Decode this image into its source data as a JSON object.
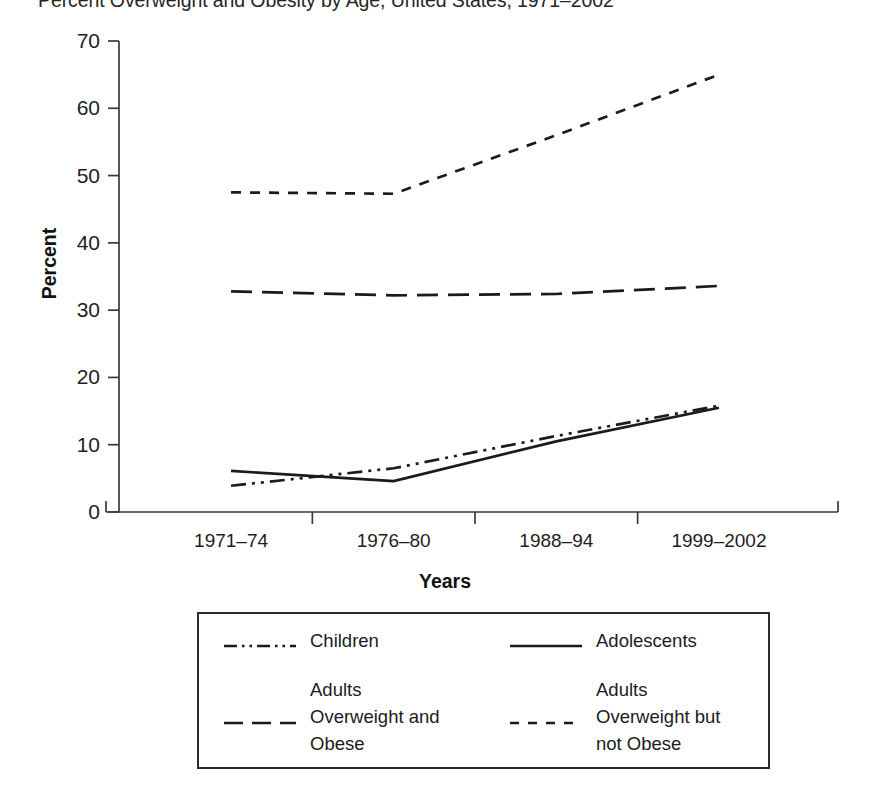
{
  "chart_data": {
    "type": "line",
    "title": "Percent Overweight and Obesity by Age, United States, 1971–2002",
    "xlabel": "Years",
    "ylabel": "Percent",
    "categories": [
      "1971–74",
      "1976–80",
      "1988–94",
      "1999–2002"
    ],
    "ylim": [
      0,
      70
    ],
    "yticks": [
      0,
      10,
      20,
      30,
      40,
      50,
      60,
      70
    ],
    "ytick_labels": [
      "0",
      "10",
      "20",
      "30",
      "40",
      "50",
      "60",
      "70"
    ],
    "grid": false,
    "legend_position": "below-plot",
    "series": [
      {
        "name": "Children",
        "legend_label": "Children",
        "line_style": "dash-dot-dot",
        "color": "#1b1b1b",
        "values": [
          3.9,
          6.5,
          11.3,
          15.8
        ]
      },
      {
        "name": "Adolescents",
        "legend_label": "Adolescents",
        "line_style": "solid",
        "color": "#1b1b1b",
        "values": [
          6.1,
          4.6,
          10.5,
          15.5
        ]
      },
      {
        "name": "Adults Overweight and Obese",
        "legend_label": "Adults\nOverweight and\nObese",
        "line_style": "long-dash",
        "color": "#1b1b1b",
        "values": [
          32.8,
          32.2,
          32.4,
          33.6
        ]
      },
      {
        "name": "Adults Overweight but not Obese",
        "legend_label": "Adults\nOverweight but\nnot Obese",
        "line_style": "short-dash",
        "color": "#1b1b1b",
        "values": [
          47.5,
          47.3,
          56.0,
          65.0
        ]
      }
    ]
  },
  "axis": {
    "y_title": "Percent",
    "x_title": "Years",
    "axis_color": "#3a3a3a"
  },
  "legend": {
    "entries": [
      {
        "label": "Children",
        "style": "dash-dot-dot"
      },
      {
        "label": "Adolescents",
        "style": "solid"
      },
      {
        "label": "Adults\nOverweight and\nObese",
        "style": "long-dash"
      },
      {
        "label": "Adults\nOverweight but\nnot Obese",
        "style": "short-dash"
      }
    ]
  }
}
